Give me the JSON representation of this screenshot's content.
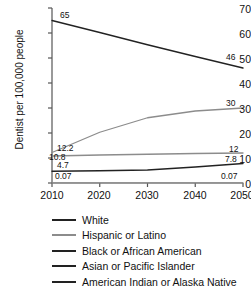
{
  "chart_data": {
    "type": "line",
    "title": "",
    "xlabel": "",
    "ylabel": "Dentist per 100,000 people",
    "x": [
      2010,
      2020,
      2030,
      2040,
      2050
    ],
    "xlim": [
      2010,
      2050
    ],
    "ylim": [
      0,
      70
    ],
    "yticks": [
      0,
      10,
      20,
      30,
      40,
      50,
      60,
      70
    ],
    "xticks": [
      "2010",
      "2020",
      "2030",
      "2040",
      "2050"
    ],
    "grid": false,
    "legend_position": "below",
    "series": [
      {
        "name": "White",
        "color": "#222222",
        "values": [
          65,
          60.2,
          55.3,
          50.6,
          46
        ],
        "start_label": "65",
        "end_label": "46"
      },
      {
        "name": "Hispanic or Latino",
        "color": "#8c8c8c",
        "values": [
          12.2,
          20.3,
          26.1,
          28.8,
          30
        ],
        "start_label": "12.2",
        "end_label": "30"
      },
      {
        "name": "Black or African American",
        "color": "#8c8c8c",
        "values": [
          10.8,
          11.2,
          11.5,
          11.8,
          12
        ],
        "start_label": "10.8",
        "end_label": "12"
      },
      {
        "name": "Asian or Pacific Islander",
        "color": "#222222",
        "values": [
          4.7,
          4.9,
          5.2,
          6.4,
          7.8
        ],
        "start_label": "4.7",
        "end_label": "7.8"
      },
      {
        "name": "American Indian or Alaska Native",
        "color": "#8c8c8c",
        "values": [
          0.07,
          0.07,
          0.07,
          0.07,
          0.07
        ],
        "start_label": "0.07",
        "end_label": "0.07"
      }
    ]
  },
  "axis": {
    "y_tick_0": "0",
    "y_tick_10": "10",
    "y_tick_20": "20",
    "y_tick_30": "30",
    "y_tick_40": "40",
    "y_tick_50": "50",
    "y_tick_60": "60",
    "y_tick_70": "70",
    "x_tick_2010": "2010",
    "x_tick_2020": "2020",
    "x_tick_2030": "2030",
    "x_tick_2040": "2040",
    "x_tick_2050": "2050",
    "y_axis_title": "Dentist per 100,000 people"
  },
  "labels": {
    "white_start": "65",
    "white_end": "46",
    "hispanic_start": "12.2",
    "hispanic_end": "30",
    "black_start": "10.8",
    "black_end": "12",
    "asian_start": "4.7",
    "asian_end": "7.8",
    "aian_start": "0.07",
    "aian_end": "0.07"
  },
  "legend": {
    "items": [
      {
        "label": "White",
        "color": "#222222"
      },
      {
        "label": "Hispanic or Latino",
        "color": "#8c8c8c"
      },
      {
        "label": "Black or African American",
        "color": "#222222"
      },
      {
        "label": "Asian or Pacific Islander",
        "color": "#222222"
      },
      {
        "label": "American Indian or Alaska Native",
        "color": "#222222"
      }
    ]
  }
}
